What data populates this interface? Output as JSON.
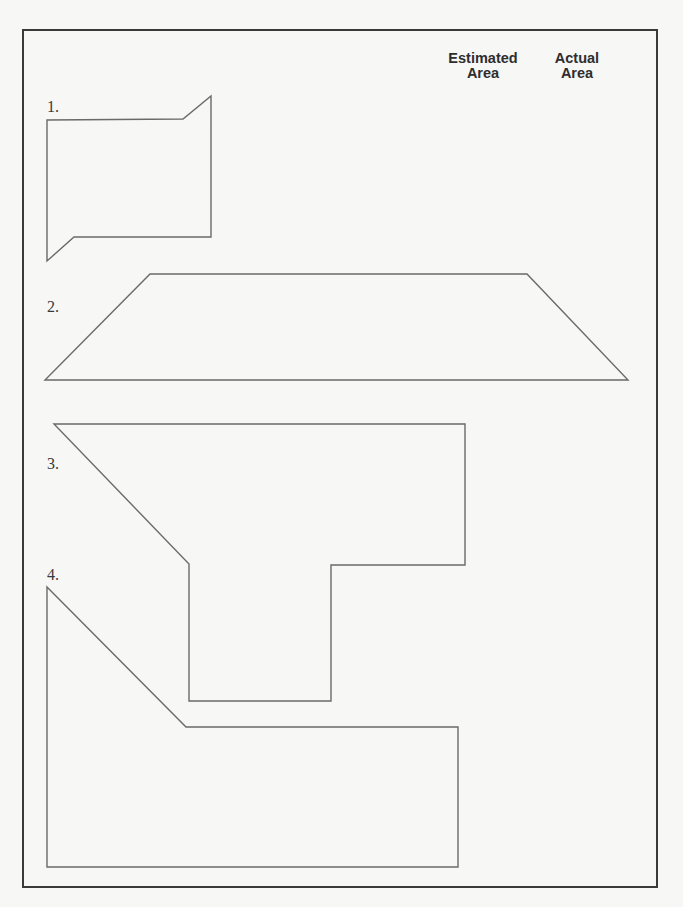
{
  "worksheet": {
    "columns": {
      "estimated": {
        "line1": "Estimated",
        "line2": "Area"
      },
      "actual": {
        "line1": "Actual",
        "line2": "Area"
      }
    },
    "problems": [
      {
        "label": "1.",
        "label_pos": [
          47,
          99
        ],
        "points": "47,120 183,119 211,96 211,237 74,237 47,261"
      },
      {
        "label": "2.",
        "label_pos": [
          47,
          299
        ],
        "points": "150,274 527,274 628,380 45,380"
      },
      {
        "label": "3.",
        "label_pos": [
          47,
          456
        ],
        "points": "54,424 465,424 465,565 331,565 331,701 189,701 189,564"
      },
      {
        "label": "4.",
        "label_pos": [
          47,
          567
        ],
        "points": "47,587 186,727 458,727 458,867 47,867"
      }
    ],
    "colors": {
      "frame": "#3a3a3a",
      "shape_stroke": "#6a6a6a",
      "background": "#f7f7f6"
    }
  }
}
